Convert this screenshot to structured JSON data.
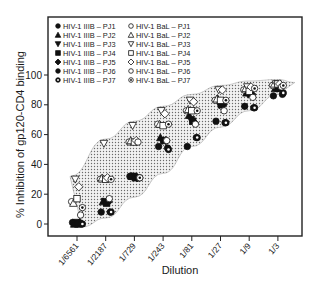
{
  "chart_data": {
    "type": "scatter",
    "title": "",
    "xlabel": "Dilution",
    "ylabel": "% Inhibition of gp120-CD4 binding",
    "categories": [
      "1/6561",
      "1/2187",
      "1/729",
      "1/243",
      "1/81",
      "1/27",
      "1/9",
      "1/3"
    ],
    "yticks": [
      0,
      20,
      40,
      60,
      80,
      100
    ],
    "ylim": [
      -8,
      137
    ],
    "grid": false,
    "legend_position": "upper-left-inside",
    "band": {
      "description": "dotted shaded envelope enclosing all data",
      "upper": [
        32,
        57,
        69,
        79,
        87,
        93,
        96,
        97
      ],
      "lower": [
        -2,
        4,
        18,
        34,
        52,
        65,
        76,
        87
      ]
    },
    "series": [
      {
        "name": "HIV-1 IIIB – PJ1",
        "marker": "circle",
        "filled": true,
        "values": [
          1,
          8,
          32,
          52,
          52,
          69,
          79,
          86
        ]
      },
      {
        "name": "HIV-1 IIIB – PJ2",
        "marker": "triangle-up",
        "filled": true,
        "values": [
          0,
          15,
          32,
          58,
          73,
          84,
          88,
          91
        ]
      },
      {
        "name": "HIV-1 IIIB – PJ3",
        "marker": "triangle-down",
        "filled": true,
        "values": [
          1,
          15,
          32,
          56,
          70,
          80,
          87,
          91
        ]
      },
      {
        "name": "HIV-1 IIIB – PJ4",
        "marker": "square",
        "filled": true,
        "values": [
          0,
          14,
          31,
          56,
          69,
          80,
          88,
          91
        ]
      },
      {
        "name": "HIV-1 IIIB – PJ5",
        "marker": "diamond",
        "filled": true,
        "values": [
          1,
          15,
          31,
          56,
          68,
          80,
          87,
          92
        ]
      },
      {
        "name": "HIV-1 IIIB – PJ6",
        "marker": "circle",
        "filled": true,
        "values": [
          0,
          8,
          31,
          51,
          58,
          68,
          78,
          87
        ]
      },
      {
        "name": "HIV-1 IIIB – PJ7",
        "marker": "circle-dot",
        "filled": true,
        "values": [
          0,
          8,
          31,
          50,
          58,
          68,
          78,
          88
        ]
      },
      {
        "name": "HIV-1 BaL – PJ1",
        "marker": "circle",
        "filled": false,
        "values": [
          15,
          30,
          55,
          67,
          76,
          83,
          90,
          93
        ]
      },
      {
        "name": "HIV-1 BaL – PJ2",
        "marker": "triangle-up",
        "filled": false,
        "values": [
          14,
          31,
          56,
          67,
          77,
          84,
          91,
          94
        ]
      },
      {
        "name": "HIV-1 BaL – PJ3",
        "marker": "triangle-down",
        "filled": false,
        "values": [
          30,
          54,
          66,
          76,
          83,
          90,
          92,
          94
        ]
      },
      {
        "name": "HIV-1 BaL – PJ4",
        "marker": "square",
        "filled": false,
        "values": [
          17,
          30,
          55,
          66,
          76,
          83,
          89,
          94
        ]
      },
      {
        "name": "HIV-1 BaL – PJ5",
        "marker": "diamond",
        "filled": false,
        "values": [
          25,
          31,
          56,
          74,
          82,
          90,
          92,
          94
        ]
      },
      {
        "name": "HIV-1 BaL – PJ6",
        "marker": "circle",
        "filled": false,
        "values": [
          6,
          17,
          55,
          56,
          67,
          76,
          85,
          92
        ]
      },
      {
        "name": "HIV-1 BaL – PJ7",
        "marker": "circle-dot",
        "filled": false,
        "values": [
          11,
          30,
          31,
          67,
          76,
          83,
          91,
          93
        ]
      }
    ]
  }
}
